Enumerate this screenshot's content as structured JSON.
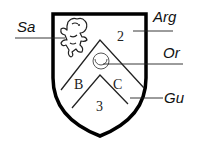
{
  "diagram": {
    "type": "heraldic-shield",
    "labels": {
      "sa": "Sa",
      "arg": "Arg",
      "or": "Or",
      "gu": "Gu"
    },
    "field_marks": {
      "two": "2",
      "b": "B",
      "c": "C",
      "three": "3"
    },
    "charges": [
      "lion-rampant",
      "annulet",
      "chevron",
      "chevron"
    ],
    "colors": {
      "outline": "#000000",
      "background": "#ffffff",
      "text": "#111111"
    }
  }
}
